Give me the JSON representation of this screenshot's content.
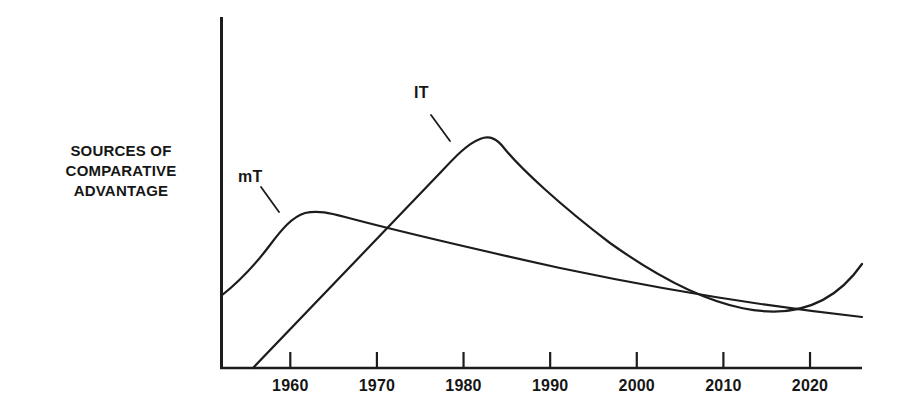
{
  "chart_data": {
    "type": "line",
    "title": "",
    "subtitle": "",
    "xlabel": "",
    "ylabel": "SOURCES OF COMPARATIVE ADVANTAGE",
    "ylabel_lines": [
      "SOURCES OF",
      "COMPARATIVE",
      "ADVANTAGE"
    ],
    "grid": false,
    "legend_position": "inline-annotations",
    "xlim": [
      1952,
      2026
    ],
    "ylim": [
      0,
      100
    ],
    "y_axis_ticks": [],
    "y_axis_tick_labels": [],
    "x_tick_values": [
      1960,
      1970,
      1980,
      1990,
      2000,
      2010,
      2020
    ],
    "x_tick_labels": [
      "1960",
      "1970",
      "1980",
      "1990",
      "2000",
      "2010",
      "2020"
    ],
    "annotations": [
      {
        "text": "mT",
        "for_series": "mT",
        "x": 1955.5,
        "y": 63
      },
      {
        "text": "IT",
        "for_series": "IT",
        "x": 1973,
        "y": 87
      }
    ],
    "series": [
      {
        "name": "mT",
        "label": "mT",
        "color": "#1c1c1c",
        "points": [
          {
            "x": 1952,
            "y": 21
          },
          {
            "x": 1962,
            "y": 44
          },
          {
            "x": 1970,
            "y": 40
          },
          {
            "x": 1980,
            "y": 36
          },
          {
            "x": 1990,
            "y": 31
          },
          {
            "x": 2000,
            "y": 26
          },
          {
            "x": 2010,
            "y": 21
          },
          {
            "x": 2020,
            "y": 17
          },
          {
            "x": 2026,
            "y": 15
          }
        ]
      },
      {
        "name": "IT",
        "label": "IT",
        "color": "#1c1c1c",
        "points": [
          {
            "x": 1956,
            "y": 0
          },
          {
            "x": 1965,
            "y": 25
          },
          {
            "x": 1975,
            "y": 53
          },
          {
            "x": 1982,
            "y": 66
          },
          {
            "x": 1990,
            "y": 59
          },
          {
            "x": 2000,
            "y": 48
          },
          {
            "x": 2010,
            "y": 37
          },
          {
            "x": 2020,
            "y": 27
          },
          {
            "x": 2026,
            "y": 30
          }
        ]
      }
    ],
    "crossover": {
      "x": 1971,
      "note": "mT and IT curves intersect near 1970"
    }
  },
  "figure": {
    "background_color": "#ffffff",
    "line_color": "#1c1c1c",
    "axis_color": "#1c1c1c",
    "text_color": "#161616"
  }
}
